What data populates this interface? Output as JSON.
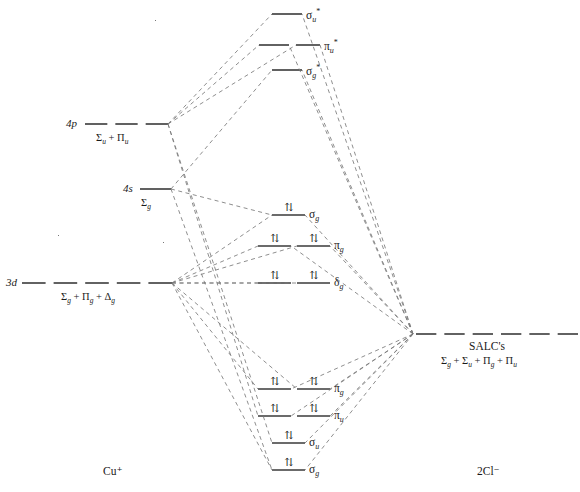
{
  "diagram": {
    "fragments": {
      "left_label": "Cu⁺",
      "right_label": "2Cl⁻"
    },
    "colors": {
      "line": "#3a3a3a",
      "correlation": "#7a7a7a",
      "text": "#1a1a1a"
    },
    "electron_glyph": "⇅",
    "left_levels": [
      {
        "name": "4p",
        "orbital_label": "4p",
        "term_label": "Σu + Πu",
        "term_html": "Σ<sub>u</sub> + Π<sub>u</sub>",
        "y": 124,
        "x_start": 85,
        "x_end": 168,
        "dashes": 3,
        "style": "dashed"
      },
      {
        "name": "4s",
        "orbital_label": "4s",
        "term_label": "Σg",
        "term_html": "Σ<sub>g</sub>",
        "y": 189,
        "x_start": 140,
        "x_end": 171,
        "dashes": 1,
        "style": "solid"
      },
      {
        "name": "3d",
        "orbital_label": "3d",
        "term_label": "Σg + Πg + Δg",
        "term_html": "Σ<sub>g</sub> + Π<sub>g</sub> + Δ<sub>g</sub>",
        "y": 283,
        "x_start": 22,
        "x_end": 172,
        "dashes": 5,
        "style": "dashed"
      }
    ],
    "right_levels": [
      {
        "name": "salc",
        "title": "SALC's",
        "term_label": "Σg + Σu + Πg + Πu",
        "term_html": "Σ<sub>g</sub> + Σ<sub>u</sub> + Π<sub>g</sub> + Π<sub>u</sub>",
        "y": 334,
        "x_start": 416,
        "x_end": 578,
        "dashes": 6,
        "style": "dashed"
      }
    ],
    "mo_levels": [
      {
        "name": "sigma-u-star",
        "label": "σu*",
        "label_html": "σ<sub>u</sub><sup>*</sup>",
        "y": 14,
        "segments": [
          [
            272,
            302
          ]
        ],
        "electrons": 0,
        "occupied": false
      },
      {
        "name": "pi-u-star",
        "label": "πu*",
        "label_html": "π<sub>u</sub><sup>*</sup>",
        "y": 45,
        "segments": [
          [
            259,
            289
          ],
          [
            296,
            320
          ]
        ],
        "electrons": 0,
        "occupied": false
      },
      {
        "name": "sigma-g-star",
        "label": "σg*",
        "label_html": "σ<sub>g</sub><sup>*</sup>",
        "y": 70,
        "segments": [
          [
            272,
            302
          ]
        ],
        "electrons": 0,
        "occupied": false
      },
      {
        "name": "sigma-g-bonding-mid",
        "label": "σg",
        "label_html": "σ<sub>g</sub>",
        "y": 215,
        "segments": [
          [
            272,
            305
          ]
        ],
        "electrons": 2,
        "occupied": true
      },
      {
        "name": "pi-g",
        "label": "πg",
        "label_html": "π<sub>g</sub>",
        "y": 246,
        "segments": [
          [
            258,
            291
          ],
          [
            297,
            330
          ]
        ],
        "electrons": 4,
        "occupied": true
      },
      {
        "name": "delta-g",
        "label": "δg",
        "label_html": "δ<sub>g</sub>",
        "y": 283,
        "segments": [
          [
            258,
            291
          ],
          [
            297,
            330
          ]
        ],
        "electrons": 4,
        "occupied": true
      },
      {
        "name": "pi-g-bonding",
        "label": "πg",
        "label_html": "π<sub>g</sub>",
        "y": 389,
        "segments": [
          [
            258,
            291
          ],
          [
            297,
            330
          ]
        ],
        "electrons": 4,
        "occupied": true
      },
      {
        "name": "pi-u-bonding",
        "label": "πu",
        "label_html": "π<sub>u</sub>",
        "y": 416,
        "segments": [
          [
            258,
            291
          ],
          [
            297,
            330
          ]
        ],
        "electrons": 4,
        "occupied": true
      },
      {
        "name": "sigma-u-bonding",
        "label": "σu",
        "label_html": "σ<sub>u</sub>",
        "y": 443,
        "segments": [
          [
            272,
            305
          ]
        ],
        "electrons": 2,
        "occupied": true
      },
      {
        "name": "sigma-g-bonding",
        "label": "σg",
        "label_html": "σ<sub>g</sub>",
        "y": 470,
        "segments": [
          [
            272,
            305
          ]
        ],
        "electrons": 2,
        "occupied": true
      }
    ],
    "correlation_nodes": {
      "p_left": [
        168,
        124
      ],
      "s_left": [
        171,
        189
      ],
      "d_left": [
        172,
        283
      ],
      "salc_right": [
        413,
        334
      ]
    }
  }
}
